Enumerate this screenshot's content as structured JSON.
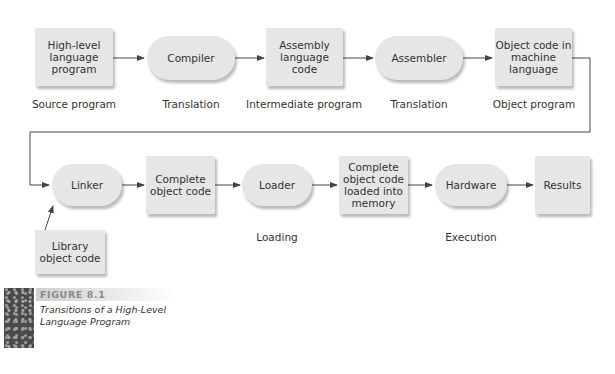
{
  "diagram": {
    "row1": {
      "nodes": [
        {
          "label": "High-level language program",
          "shape": "rect"
        },
        {
          "label": "Compiler",
          "shape": "pill"
        },
        {
          "label": "Assembly language code",
          "shape": "rect"
        },
        {
          "label": "Assembler",
          "shape": "pill"
        },
        {
          "label": "Object code in machine language",
          "shape": "rect"
        }
      ],
      "captions": [
        "Source program",
        "Translation",
        "Intermediate program",
        "Translation",
        "Object program"
      ]
    },
    "row2": {
      "nodes": [
        {
          "label": "Linker",
          "shape": "pill"
        },
        {
          "label": "Complete object code",
          "shape": "rect"
        },
        {
          "label": "Loader",
          "shape": "pill"
        },
        {
          "label": "Complete object code loaded into memory",
          "shape": "rect"
        },
        {
          "label": "Hardware",
          "shape": "pill"
        },
        {
          "label": "Results",
          "shape": "rect"
        }
      ],
      "captions": [
        "Loading",
        "Execution"
      ]
    },
    "library": {
      "label": "Library object code",
      "shape": "rect"
    }
  },
  "figure": {
    "number": "FIGURE 8.1",
    "caption_line1": "Transitions of a High-Level",
    "caption_line2": "Language Program"
  },
  "colors": {
    "node_fill": "#e6e6e6",
    "arrow": "#444444",
    "figure_number": "#8a8a8a"
  }
}
